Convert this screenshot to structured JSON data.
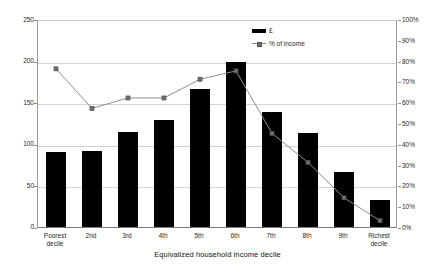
{
  "chart_data": {
    "type": "bar",
    "title": "",
    "xlabel": "Equivalized household income decile",
    "ylabel": "",
    "categories": [
      "Poorest decile",
      "2nd",
      "3rd",
      "4th",
      "5th",
      "6th",
      "7th",
      "8th",
      "9th",
      "Richest decile"
    ],
    "series": [
      {
        "name": "£",
        "type": "bar",
        "axis": "left",
        "values": [
          90,
          91,
          114,
          129,
          166,
          198,
          138,
          113,
          66,
          33
        ]
      },
      {
        "name": "% of income",
        "type": "line",
        "axis": "right",
        "values": [
          77,
          58,
          63,
          63,
          72,
          76,
          46,
          32,
          15,
          4
        ]
      }
    ],
    "left_axis": {
      "ticks": [
        "0",
        "50",
        "100",
        "150",
        "200",
        "250"
      ],
      "ylim": [
        0,
        250
      ],
      "interval": 50
    },
    "right_axis": {
      "ticks": [
        "0%",
        "10%",
        "20%",
        "30%",
        "40%",
        "50%",
        "60%",
        "70%",
        "80%",
        "90%",
        "100%"
      ],
      "ylim": [
        0,
        100
      ],
      "interval": 10
    },
    "grid": true,
    "legend_position": "top-right",
    "colors": {
      "bar": "#000000",
      "line": "#8e8e8e",
      "marker": "#6f6f6f",
      "grid": "#d2d2d2",
      "axis": "#8d8d8d",
      "text": "#1f1f1f"
    }
  },
  "legend": {
    "entries": [
      {
        "label": "£",
        "marker": "bar-swatch"
      },
      {
        "label": "% of income",
        "marker": "line-square-marker"
      }
    ]
  }
}
